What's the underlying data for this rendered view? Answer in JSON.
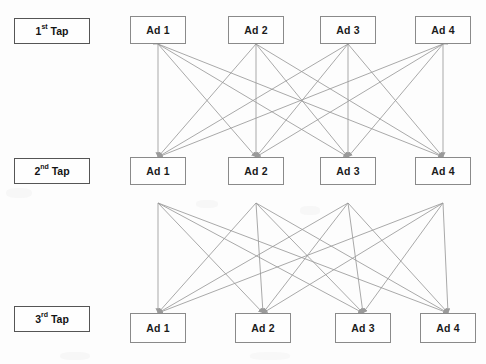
{
  "diagram": {
    "edge_color": "#9a9a9a",
    "box_border_color": "#8a8a8a",
    "tap_border_color": "#555555",
    "background_color": "#fdfdfd",
    "tiers": [
      {
        "id": "tier-1",
        "tap_label_prefix": "1",
        "tap_label_ordinal": "st",
        "tap_label_suffix": " Tap",
        "tap_label_full": "1st Tap",
        "tap_box": {
          "x": 14,
          "y": 18,
          "w": 76,
          "h": 26
        },
        "nodes": [
          {
            "label": "Ad 1",
            "x": 130,
            "y": 16,
            "w": 56,
            "h": 28
          },
          {
            "label": "Ad 2",
            "x": 228,
            "y": 16,
            "w": 56,
            "h": 28
          },
          {
            "label": "Ad 3",
            "x": 320,
            "y": 16,
            "w": 56,
            "h": 28
          },
          {
            "label": "Ad 4",
            "x": 415,
            "y": 16,
            "w": 56,
            "h": 28
          }
        ]
      },
      {
        "id": "tier-2",
        "tap_label_prefix": "2",
        "tap_label_ordinal": "nd",
        "tap_label_suffix": " Tap",
        "tap_label_full": "2nd Tap",
        "tap_box": {
          "x": 14,
          "y": 158,
          "w": 76,
          "h": 26
        },
        "nodes": [
          {
            "label": "Ad 1",
            "x": 130,
            "y": 157,
            "w": 56,
            "h": 28
          },
          {
            "label": "Ad 2",
            "x": 228,
            "y": 157,
            "w": 56,
            "h": 28
          },
          {
            "label": "Ad 3",
            "x": 320,
            "y": 157,
            "w": 56,
            "h": 28
          },
          {
            "label": "Ad 4",
            "x": 415,
            "y": 157,
            "w": 56,
            "h": 28
          }
        ]
      },
      {
        "id": "tier-3",
        "tap_label_prefix": "3",
        "tap_label_ordinal": "rd",
        "tap_label_suffix": " Tap",
        "tap_label_full": "3rd Tap",
        "tap_box": {
          "x": 14,
          "y": 306,
          "w": 76,
          "h": 26
        },
        "nodes": [
          {
            "label": "Ad 1",
            "x": 130,
            "y": 313,
            "w": 56,
            "h": 30
          },
          {
            "label": "Ad 2",
            "x": 235,
            "y": 313,
            "w": 56,
            "h": 30
          },
          {
            "label": "Ad 3",
            "x": 335,
            "y": 313,
            "w": 56,
            "h": 30
          },
          {
            "label": "Ad 4",
            "x": 420,
            "y": 313,
            "w": 56,
            "h": 30
          }
        ]
      }
    ],
    "edge_groups": [
      {
        "id": "edges-tier1-to-tier2",
        "from_tier": "tier-1",
        "to_tier": "tier-2",
        "direction": "bidirectional-fan",
        "complete_bipartite": true,
        "source_y": 44,
        "target_y": 157,
        "note": "Every 1st Tap ad connects to every 2nd Tap ad; arrowheads at both tiers"
      },
      {
        "id": "edges-tier2-to-tier3",
        "from_tier": "tier-2",
        "to_tier": "tier-3",
        "direction": "downward",
        "complete_bipartite": true,
        "source_y": 203,
        "target_y": 313,
        "note": "Every 2nd Tap ad connects to every 3rd Tap ad; arrowheads at 3rd Tap"
      }
    ]
  }
}
